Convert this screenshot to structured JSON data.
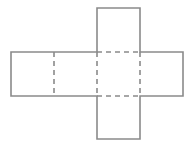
{
  "diagram": {
    "type": "cube-net",
    "canvas": {
      "width": 195,
      "height": 147,
      "background": "#ffffff"
    },
    "style": {
      "stroke_color": "#8a8a8a",
      "stroke_width": 1.6,
      "dash_pattern": "5,4"
    },
    "unit": 43,
    "faces": [
      {
        "id": "face-row-1",
        "x": 11,
        "y": 52,
        "w": 43,
        "h": 44
      },
      {
        "id": "face-row-2",
        "x": 54,
        "y": 52,
        "w": 43,
        "h": 44
      },
      {
        "id": "face-center",
        "x": 97,
        "y": 52,
        "w": 43,
        "h": 44
      },
      {
        "id": "face-row-4",
        "x": 140,
        "y": 52,
        "w": 43,
        "h": 44
      },
      {
        "id": "face-top",
        "x": 97,
        "y": 8,
        "w": 43,
        "h": 44
      },
      {
        "id": "face-bottom",
        "x": 97,
        "y": 96,
        "w": 43,
        "h": 43
      }
    ],
    "outline_points": [
      [
        97,
        8
      ],
      [
        140,
        8
      ],
      [
        140,
        52
      ],
      [
        183,
        52
      ],
      [
        183,
        96
      ],
      [
        140,
        96
      ],
      [
        140,
        139
      ],
      [
        97,
        139
      ],
      [
        97,
        96
      ],
      [
        11,
        96
      ],
      [
        11,
        52
      ],
      [
        97,
        52
      ]
    ],
    "fold_lines": [
      {
        "id": "fold-1-2",
        "x1": 54,
        "y1": 52,
        "x2": 54,
        "y2": 96
      },
      {
        "id": "fold-2-center",
        "x1": 97,
        "y1": 52,
        "x2": 97,
        "y2": 96
      },
      {
        "id": "fold-center-4",
        "x1": 140,
        "y1": 52,
        "x2": 140,
        "y2": 96
      },
      {
        "id": "fold-top-center",
        "x1": 97,
        "y1": 52,
        "x2": 140,
        "y2": 52
      },
      {
        "id": "fold-center-bottom",
        "x1": 97,
        "y1": 96,
        "x2": 140,
        "y2": 96
      }
    ]
  }
}
